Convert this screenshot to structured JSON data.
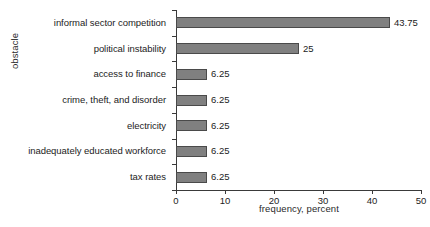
{
  "chart_data": {
    "type": "bar",
    "orientation": "horizontal",
    "title": "",
    "xlabel": "frequency, percent",
    "ylabel": "obstacle",
    "xlim": [
      0,
      50
    ],
    "xticks": [
      0,
      10,
      20,
      30,
      40,
      50
    ],
    "xtick_labels": [
      "0",
      "10",
      "20",
      "30",
      "40",
      "50"
    ],
    "grid": false,
    "legend": false,
    "bar_color": "#808080",
    "bar_edge_color": "#4a4a4a",
    "background_color": "#ffffff",
    "categories": [
      "informal sector competition",
      "political instability",
      "access to finance",
      "crime, theft, and disorder",
      "electricity",
      "inadequately educated workforce",
      "tax rates"
    ],
    "values": [
      43.75,
      25,
      6.25,
      6.25,
      6.25,
      6.25,
      6.25
    ],
    "value_labels": [
      "43.75",
      "25",
      "6.25",
      "6.25",
      "6.25",
      "6.25",
      "6.25"
    ]
  }
}
